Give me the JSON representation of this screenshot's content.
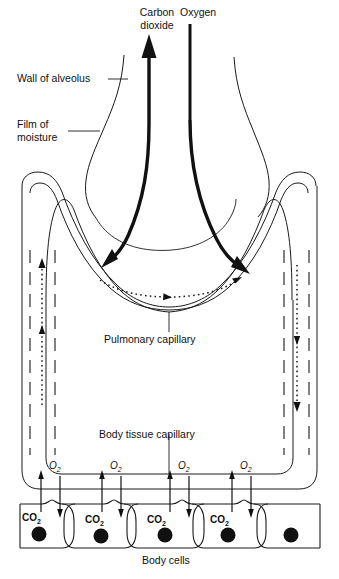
{
  "diagram": {
    "labels": {
      "carbon_dioxide_line1": "Carbon",
      "carbon_dioxide_line2": "dioxide",
      "oxygen": "Oxygen",
      "wall_of_alveolus": "Wall of alveolus",
      "film_of_moisture_line1": "Film of",
      "film_of_moisture_line2": "moisture",
      "pulmonary_capillary": "Pulmonary capillary",
      "body_tissue_capillary": "Body tissue capillary",
      "body_cells": "Body cells"
    },
    "gas_symbols": {
      "oxygen_symbol": "O",
      "oxygen_subscript": "2",
      "carbon_dioxide_symbol": "CO",
      "carbon_dioxide_subscript": "2"
    },
    "oxygen_markers": [
      {
        "label_symbol": "O",
        "label_sub": "2",
        "x": 57
      },
      {
        "label_symbol": "O",
        "label_sub": "2",
        "x": 118
      },
      {
        "label_symbol": "O",
        "label_sub": "2",
        "x": 186
      },
      {
        "label_symbol": "O",
        "label_sub": "2",
        "x": 248
      }
    ],
    "body_cells": [
      {
        "has_co2_label": true,
        "co2_symbol": "CO",
        "co2_sub": "2",
        "nucleus": true
      },
      {
        "has_co2_label": true,
        "co2_symbol": "CO",
        "co2_sub": "2",
        "nucleus": true
      },
      {
        "has_co2_label": true,
        "co2_symbol": "CO",
        "co2_sub": "2",
        "nucleus": true
      },
      {
        "has_co2_label": true,
        "co2_symbol": "CO",
        "co2_sub": "2",
        "nucleus": true
      },
      {
        "has_co2_label": false,
        "co2_symbol": "",
        "co2_sub": "",
        "nucleus": true
      }
    ],
    "colors": {
      "ink": "#1a1a1a",
      "background": "#ffffff",
      "nucleus": "#111111"
    },
    "icons": {
      "co2_arrow": "arrow-up-icon",
      "o2_arrow": "arrow-down-icon",
      "blood_flow_left": "arrow-up-dotted-icon",
      "blood_flow_right": "arrow-down-dotted-icon",
      "capillary_flow": "arrow-right-dotted-icon"
    }
  }
}
